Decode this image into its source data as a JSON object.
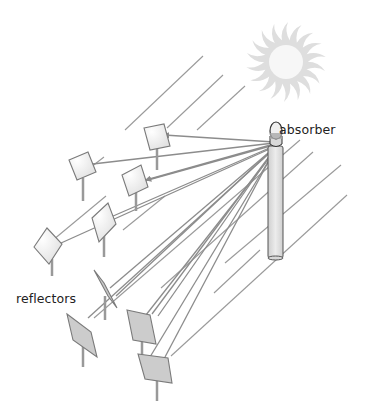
{
  "diagram": {
    "type": "solar-power-tower",
    "labels": {
      "absorber": "absorber",
      "reflectors": "reflectors"
    },
    "colors": {
      "ray": "#8c8c8c",
      "mirror_fill_light": "#efefef",
      "mirror_fill_dark": "#cccccc",
      "mirror_stroke": "#7a7a7a",
      "tower_fill": "#e2e2e2",
      "tower_stroke": "#555555",
      "sun": "#dcdcdc"
    },
    "components": [
      {
        "name": "sun",
        "icon": "sun-icon"
      },
      {
        "name": "absorber",
        "icon": "absorber-icon"
      },
      {
        "name": "tower",
        "icon": "tower-icon"
      },
      {
        "name": "reflectors",
        "count": 9
      }
    ]
  }
}
